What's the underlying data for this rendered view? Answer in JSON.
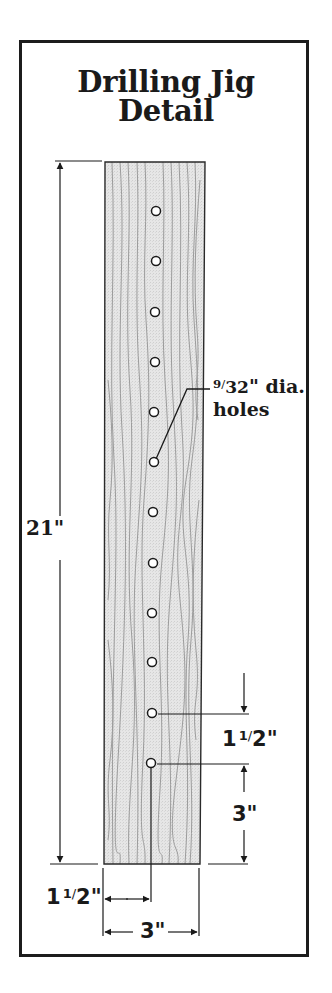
{
  "title": {
    "line1": "Drilling Jig",
    "line2": "Detail"
  },
  "board": {
    "length_label": "21\"",
    "width_label": "3\"",
    "fill_color": "#e4e4e4",
    "grain_color": "#9a9a9a"
  },
  "holes": {
    "count": 12,
    "label_num": "9",
    "label_den": "32",
    "label_rest": "\" dia.",
    "label_line2": "holes",
    "spacing_label_whole": "1",
    "spacing_label_num": "1",
    "spacing_label_den": "2",
    "spacing_label_inch": "\"",
    "end_offset_label": "3\""
  },
  "bottom_dims": {
    "edge_offset_whole": "1",
    "edge_offset_num": "1",
    "edge_offset_den": "2",
    "edge_offset_inch": "\"",
    "width_label": "3\""
  },
  "colors": {
    "ink": "#1a1a1a",
    "board": "#e4e4e4",
    "frame": "#1c1c1c"
  }
}
